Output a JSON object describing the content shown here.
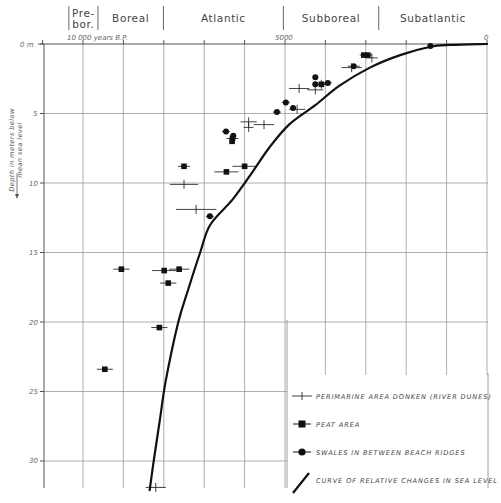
{
  "chart_data": {
    "type": "scatter",
    "title": "",
    "xlabel": "10 000 years B.P.",
    "ylabel": "Depth in meters below mean sea level",
    "x_axis": {
      "unit": "years BP",
      "direction": "reversed",
      "range": [
        11000,
        0
      ],
      "grid_step": 1000,
      "tick_labels": [
        {
          "value": 10000,
          "label": "10 000 years B.P."
        },
        {
          "value": 5000,
          "label": "5000"
        },
        {
          "value": 0,
          "label": "0"
        }
      ]
    },
    "y_axis": {
      "unit": "m",
      "direction": "down",
      "range": [
        0,
        32.5
      ],
      "grid_step": 5,
      "tick_labels": [
        {
          "value": 0,
          "label": "0 m"
        },
        {
          "value": 5,
          "label": "5"
        },
        {
          "value": 10,
          "label": "10"
        },
        {
          "value": 15,
          "label": "15"
        },
        {
          "value": 20,
          "label": "20"
        },
        {
          "value": 25,
          "label": "25"
        },
        {
          "value": 30,
          "label": "30"
        }
      ]
    },
    "grid": true,
    "legend_position": "lower right",
    "periods": [
      {
        "label_lines": [
          "Pre-",
          "bor."
        ],
        "from": 10350,
        "to": 9630
      },
      {
        "label_lines": [
          "Boreal"
        ],
        "from": 9630,
        "to": 8010
      },
      {
        "label_lines": [
          "Atlantic"
        ],
        "from": 8010,
        "to": 5040
      },
      {
        "label_lines": [
          "Subboreal"
        ],
        "from": 5040,
        "to": 2680
      },
      {
        "label_lines": [
          "Subatlantic"
        ],
        "from": 2680,
        "to": 0
      }
    ],
    "series": [
      {
        "name": "PERIMARINE AREA DONKEN (RIVER DUNES)",
        "marker": "cross",
        "points": [
          {
            "age": 4650,
            "depth": 3.2,
            "err": 250
          },
          {
            "age": 4250,
            "depth": 3.3,
            "err": 200
          },
          {
            "age": 3350,
            "depth": 1.7,
            "err": 250
          },
          {
            "age": 2850,
            "depth": 1.0,
            "err": 150
          },
          {
            "age": 5520,
            "depth": 5.8,
            "err": 250
          },
          {
            "age": 5900,
            "depth": 5.6,
            "err": 200
          },
          {
            "age": 5900,
            "depth": 6.0,
            "err": 0
          },
          {
            "age": 7500,
            "depth": 10.1,
            "err": 350
          },
          {
            "age": 7200,
            "depth": 11.9,
            "err": 500
          },
          {
            "age": 8200,
            "depth": 31.9,
            "err": 250
          },
          {
            "age": 4700,
            "depth": 4.7,
            "err": 200
          },
          {
            "age": 4100,
            "depth": 2.9,
            "err": 150
          }
        ]
      },
      {
        "name": "PEAT AREA",
        "marker": "square",
        "points": [
          {
            "age": 2950,
            "depth": 0.8,
            "err": 100
          },
          {
            "age": 3050,
            "depth": 0.8,
            "err": 100
          },
          {
            "age": 4100,
            "depth": 2.9,
            "err": 150
          },
          {
            "age": 6300,
            "depth": 6.8,
            "err": 150
          },
          {
            "age": 6310,
            "depth": 7.0,
            "err": 0
          },
          {
            "age": 7500,
            "depth": 8.8,
            "err": 150
          },
          {
            "age": 6450,
            "depth": 9.2,
            "err": 300
          },
          {
            "age": 6000,
            "depth": 8.8,
            "err": 300
          },
          {
            "age": 9050,
            "depth": 16.2,
            "err": 200
          },
          {
            "age": 7990,
            "depth": 16.3,
            "err": 300
          },
          {
            "age": 7620,
            "depth": 16.2,
            "err": 250
          },
          {
            "age": 7890,
            "depth": 17.2,
            "err": 200
          },
          {
            "age": 8110,
            "depth": 20.4,
            "err": 200
          },
          {
            "age": 9460,
            "depth": 23.4,
            "err": 200
          }
        ]
      },
      {
        "name": "SWALES IN BETWEEN BEACH RIDGES",
        "marker": "circle",
        "points": [
          {
            "age": 1400,
            "depth": 0.15,
            "err": 0
          },
          {
            "age": 3300,
            "depth": 1.6,
            "err": 150
          },
          {
            "age": 3940,
            "depth": 2.8,
            "err": 100
          },
          {
            "age": 4250,
            "depth": 2.4,
            "err": 0
          },
          {
            "age": 4250,
            "depth": 2.9,
            "err": 0
          },
          {
            "age": 4980,
            "depth": 4.2,
            "err": 100
          },
          {
            "age": 5200,
            "depth": 4.9,
            "err": 100
          },
          {
            "age": 6460,
            "depth": 6.3,
            "err": 100
          },
          {
            "age": 6280,
            "depth": 6.6,
            "err": 0
          },
          {
            "age": 6860,
            "depth": 12.4,
            "err": 100
          },
          {
            "age": 4800,
            "depth": 4.6,
            "err": 0
          }
        ]
      }
    ],
    "curve": {
      "name": "CURVE OF RELATIVE CHANGES IN SEA LEVEL",
      "points": [
        [
          0,
          0
        ],
        [
          900,
          0.07
        ],
        [
          1400,
          0.2
        ],
        [
          2150,
          0.8
        ],
        [
          2900,
          1.7
        ],
        [
          3650,
          3.0
        ],
        [
          4250,
          4.4
        ],
        [
          4900,
          5.8
        ],
        [
          5400,
          7.5
        ],
        [
          5850,
          9.4
        ],
        [
          6300,
          11.2
        ],
        [
          6850,
          13.0
        ],
        [
          7100,
          15.0
        ],
        [
          7400,
          17.7
        ],
        [
          7650,
          20.1
        ],
        [
          7950,
          24.2
        ],
        [
          8100,
          27.1
        ],
        [
          8250,
          30.0
        ],
        [
          8350,
          32.1
        ]
      ]
    }
  },
  "labels": {
    "y_axis_title_line1": "Depth in meters below",
    "y_axis_title_line2": "mean sea level",
    "x_label_10000": "10 000 years B.P.",
    "x_label_5000": "5000",
    "x_label_0": "0",
    "y_label_0": "0 m",
    "y_labels": [
      "5",
      "10",
      "15",
      "20",
      "25",
      "30"
    ]
  },
  "legend": {
    "items": [
      {
        "marker": "cross",
        "label": "PERIMARINE AREA DONKEN (RIVER DUNES)"
      },
      {
        "marker": "square",
        "label": "PEAT AREA"
      },
      {
        "marker": "circle",
        "label": "SWALES IN BETWEEN BEACH RIDGES"
      },
      {
        "marker": "line",
        "label": "CURVE OF RELATIVE CHANGES IN SEA LEVEL"
      }
    ]
  },
  "colors": {
    "ink": "#111111",
    "grid": "#9a9a9a",
    "text": "#444444"
  }
}
